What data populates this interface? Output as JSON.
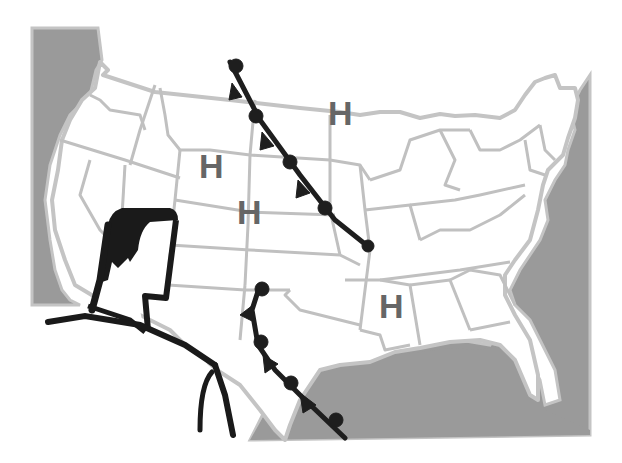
{
  "illustration": {
    "subject": "weather-forecaster-us-map",
    "colors": {
      "background": "#ffffff",
      "ocean": "#9a9a9a",
      "coast_outline": "#c4c4c4",
      "state_lines": "#c0c0c0",
      "land": "#ffffff",
      "front_lines": "#1e1e1e",
      "pressure_labels": "#666666",
      "figure_ink": "#1a1a1a"
    },
    "pressure_systems": [
      {
        "label": "H",
        "x": 342,
        "y": 125
      },
      {
        "label": "H",
        "x": 212,
        "y": 178
      },
      {
        "label": "H",
        "x": 250,
        "y": 224
      },
      {
        "label": "H",
        "x": 392,
        "y": 318
      }
    ],
    "fronts": [
      {
        "name": "northern-cold-front",
        "type": "occluded"
      },
      {
        "name": "southern-cold-front",
        "type": "occluded"
      }
    ]
  }
}
